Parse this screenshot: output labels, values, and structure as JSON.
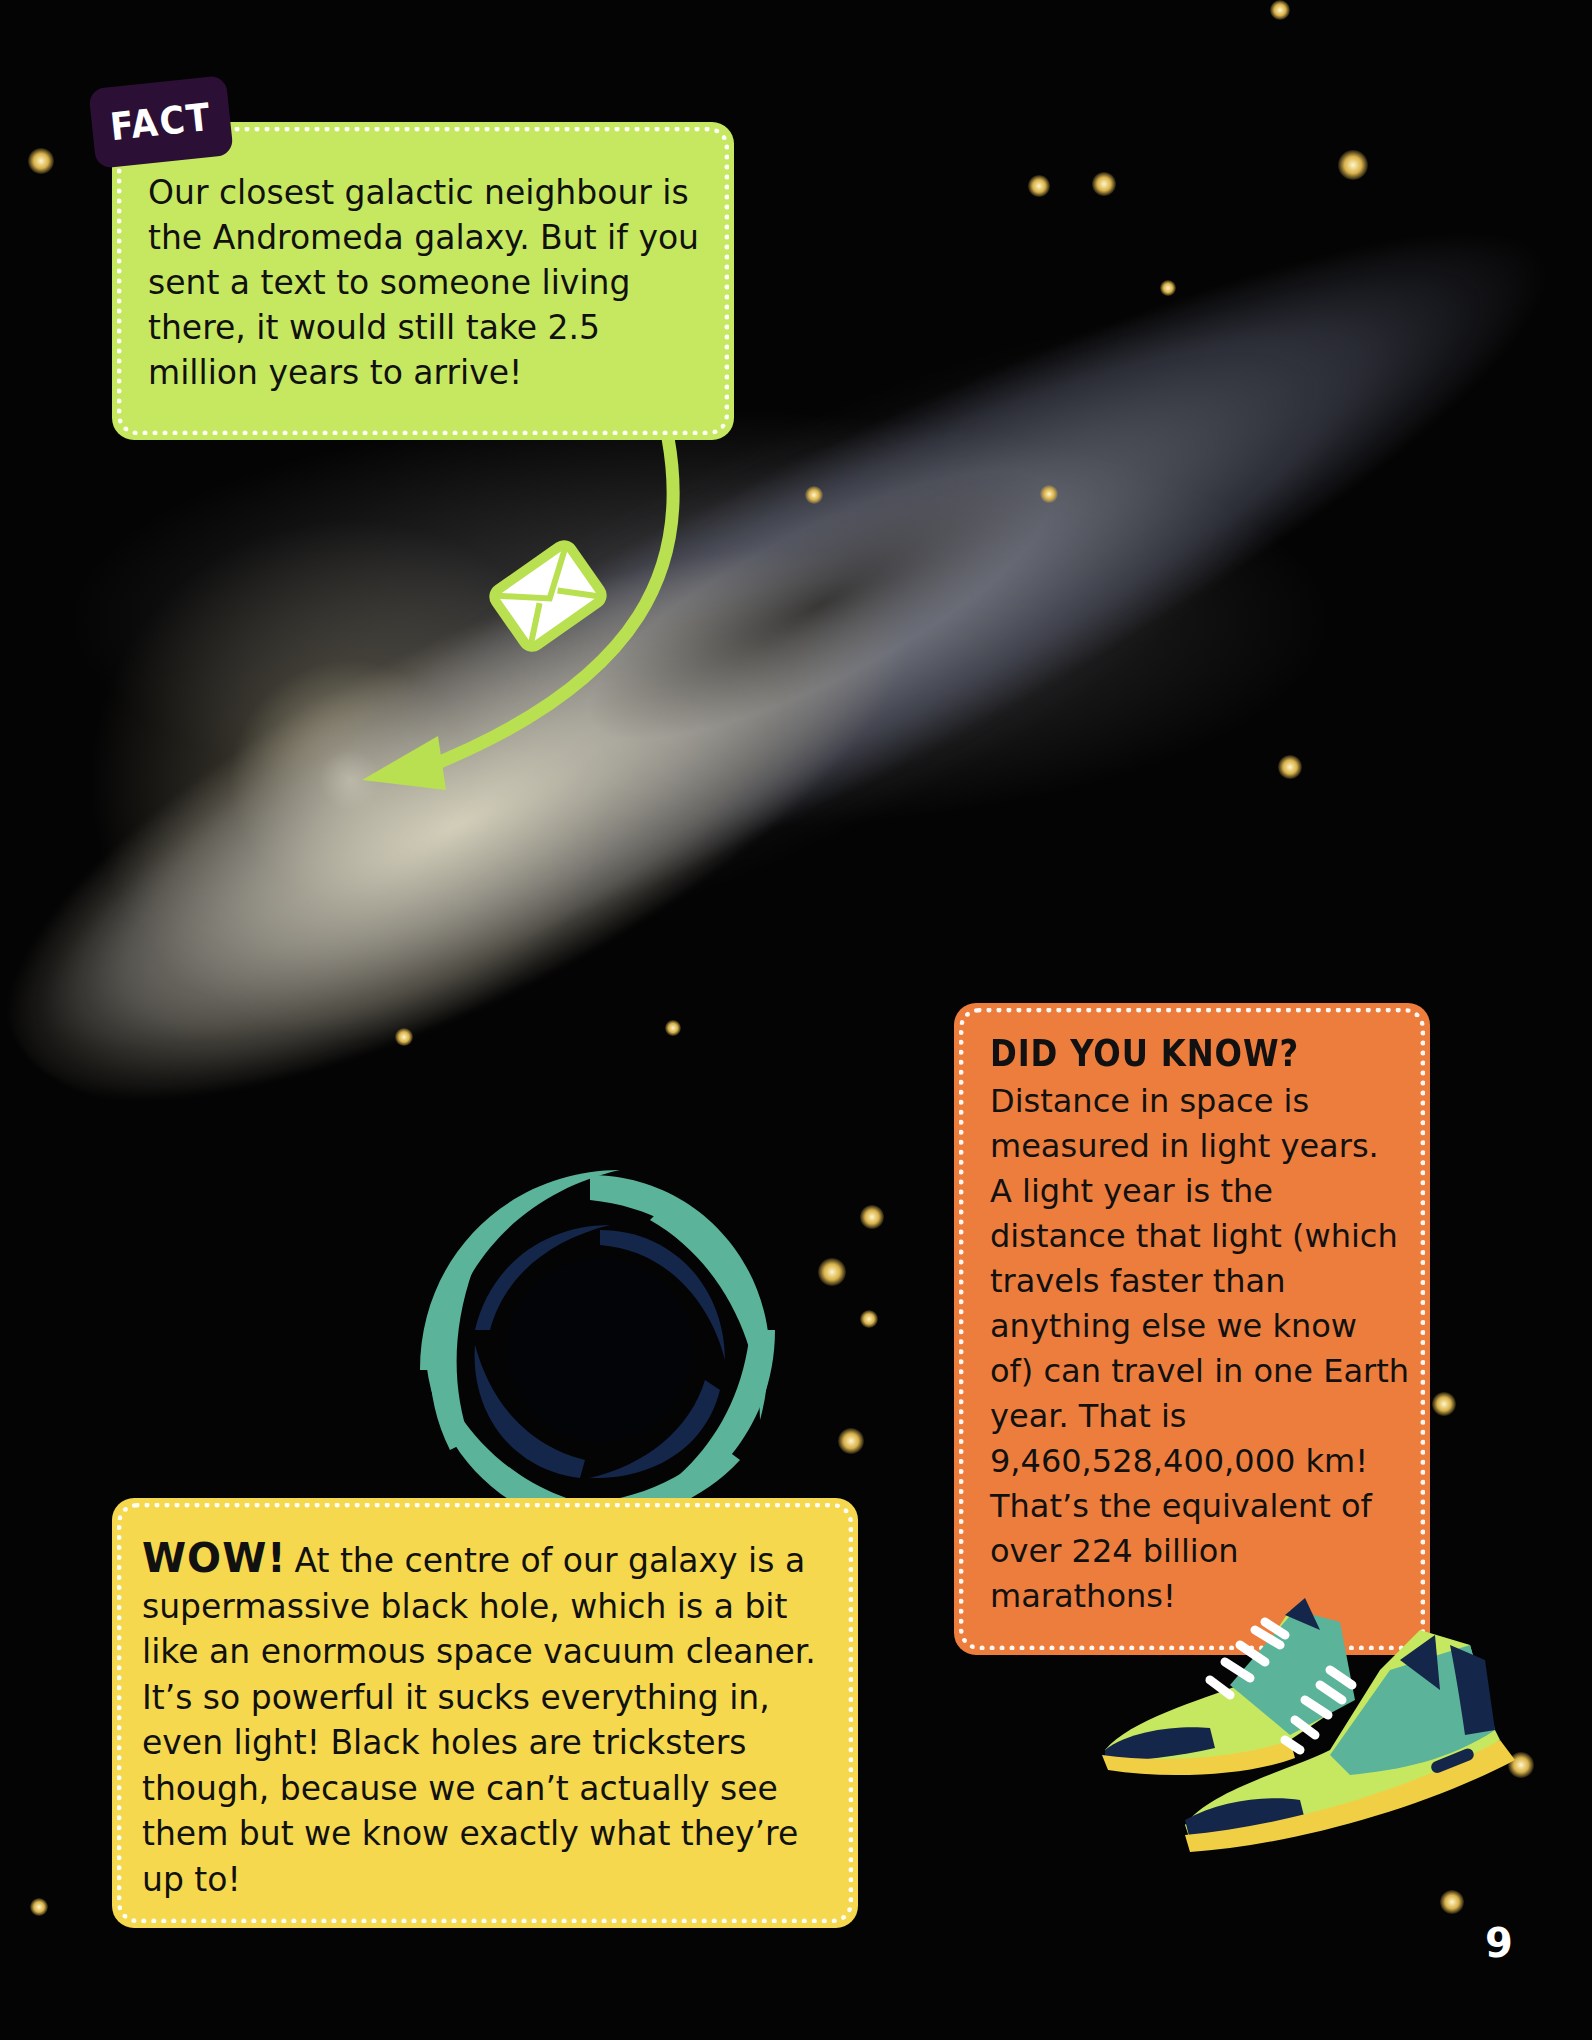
{
  "page": {
    "number": "9",
    "background": "starfield with Andromeda galaxy"
  },
  "fact_box": {
    "tag": "FACT",
    "text": "Our closest galactic neighbour is the Andromeda galaxy. But if you sent a text to someone living there, it would still take 2.5 million years to arrive!",
    "color": "#c6e860",
    "tag_color": "#2c0f34",
    "icon": "envelope-icon",
    "arrow": "curved-arrow pointing to galaxy core"
  },
  "did_you_know_box": {
    "heading": "DID YOU KNOW?",
    "text": "Distance in space is measured in light years. A light year is the distance that light (which travels faster than anything else we know of) can travel in one Earth year. That is 9,460,528,400,000 km! That’s the equivalent of over 224 billion marathons!",
    "color": "#ec7d3d",
    "illustration": "running-shoes-icon"
  },
  "wow_box": {
    "lead": "WOW!",
    "text": "At the centre of our galaxy is a supermassive black hole, which is a bit like an enormous space vacuum cleaner. It’s so powerful it sucks everything in, even light! Black holes are tricksters though, because we can’t actually see them but we know exactly what they’re up to!",
    "color": "#f5d84e",
    "illustration": "black-hole-swirl-icon"
  },
  "colors": {
    "teal": "#5bb39a",
    "navy": "#14264a",
    "lime": "#c6e860",
    "sole": "#f1cf45"
  }
}
